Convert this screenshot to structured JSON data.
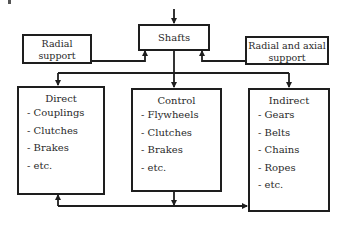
{
  "diagram": {
    "top": {
      "label": "Shafts"
    },
    "supports": [
      {
        "id": "radial",
        "lines": [
          "Radial",
          "support"
        ]
      },
      {
        "id": "radial-axial",
        "lines": [
          "Radial and axial",
          "support"
        ]
      }
    ],
    "categories": [
      {
        "id": "direct",
        "title": "Direct",
        "items": [
          "- Couplings",
          "- Clutches",
          "- Brakes",
          "- etc."
        ]
      },
      {
        "id": "control",
        "title": "Control",
        "items": [
          "- Flywheels",
          "- Clutches",
          "- Brakes",
          "- etc."
        ]
      },
      {
        "id": "indirect",
        "title": "Indirect",
        "items": [
          "- Gears",
          "- Belts",
          "- Chains",
          "- Ropes",
          "- etc."
        ]
      }
    ],
    "colors": {
      "stroke": "#1e1e1e",
      "text": "#2a2a2a",
      "background": "#ffffff"
    }
  }
}
